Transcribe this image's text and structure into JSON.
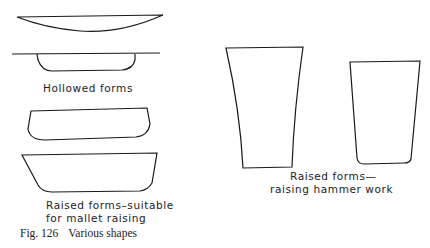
{
  "figure": {
    "number": "Fig. 126",
    "caption": "Various shapes"
  },
  "labels": {
    "hollowed": "Hollowed forms",
    "mallet_line1": "Raised forms–suitable",
    "mallet_line2": "for mallet raising",
    "hammer_line1": "Raised forms—",
    "hammer_line2": "raising hammer work"
  },
  "style": {
    "stroke_color": "#1a1a1a",
    "background": "#ffffff"
  }
}
